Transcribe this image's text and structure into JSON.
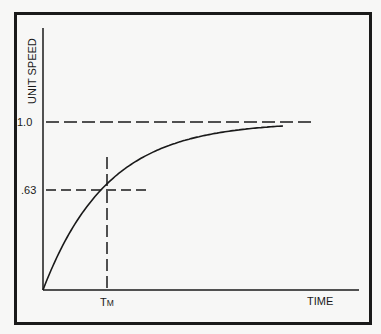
{
  "chart_data": {
    "type": "line",
    "title": "",
    "xlabel": "TIME",
    "ylabel": "UNIT SPEED",
    "x_tick_labels": [
      "TM"
    ],
    "y_tick_labels": [
      "1.0",
      ".63"
    ],
    "ylim": [
      0,
      1.0
    ],
    "grid": false,
    "legend": null,
    "series": [
      {
        "name": "unit speed",
        "function": "1 - exp(-t/TM)",
        "x_in_TM_units": [
          0,
          0.5,
          1,
          1.5,
          2,
          2.5,
          3,
          3.75
        ],
        "values": [
          0,
          0.39,
          0.63,
          0.78,
          0.86,
          0.92,
          0.95,
          0.98
        ]
      }
    ],
    "reference_lines": [
      {
        "type": "horizontal",
        "value": 1.0,
        "label": "1.0",
        "style": "dashed"
      },
      {
        "type": "horizontal",
        "value": 0.63,
        "label": ".63",
        "style": "dashed"
      },
      {
        "type": "vertical",
        "value": "TM",
        "label": "TM",
        "style": "dashed"
      }
    ]
  },
  "labels": {
    "y_axis": "UNIT SPEED",
    "x_axis": "TIME",
    "y_tick_1": "1.0",
    "y_tick_063": ".63",
    "x_tick_t": "T",
    "x_tick_m": "M"
  },
  "style": {
    "ink": "#1a1a1a",
    "paper": "#f7f7f6"
  }
}
